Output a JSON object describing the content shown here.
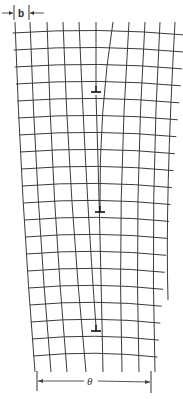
{
  "figure": {
    "labels": {
      "spacing": "b",
      "angle": "θ"
    },
    "colors": {
      "background": "#ffffff",
      "lines": "#3a3a3a",
      "symbols": "#111111"
    }
  },
  "dimension_top": {
    "tick_left_x": 14,
    "tick_right_x": 29,
    "y": 12,
    "label": "b"
  },
  "dimension_bottom": {
    "tick_left_x": 37,
    "tick_right_x": 151,
    "y": 380,
    "label": "θ"
  },
  "horizontal_lines_y_left": [
    33,
    50,
    67,
    84,
    101,
    118,
    135,
    152,
    169,
    186,
    203,
    220,
    237,
    254,
    271,
    288,
    305,
    322,
    339,
    356
  ],
  "dislocations": [
    {
      "x": 96,
      "y": 91,
      "symbol": "⊥"
    },
    {
      "x": 100,
      "y": 211,
      "symbol": "⊥"
    },
    {
      "x": 96,
      "y": 330,
      "symbol": "⊥"
    }
  ],
  "vertical_lines_top_x": [
    15,
    30,
    47,
    63,
    79,
    96,
    113,
    129,
    145,
    160,
    175
  ],
  "vertical_lines_bottom_x": [
    35,
    51,
    67,
    86,
    103,
    122,
    139,
    155
  ]
}
